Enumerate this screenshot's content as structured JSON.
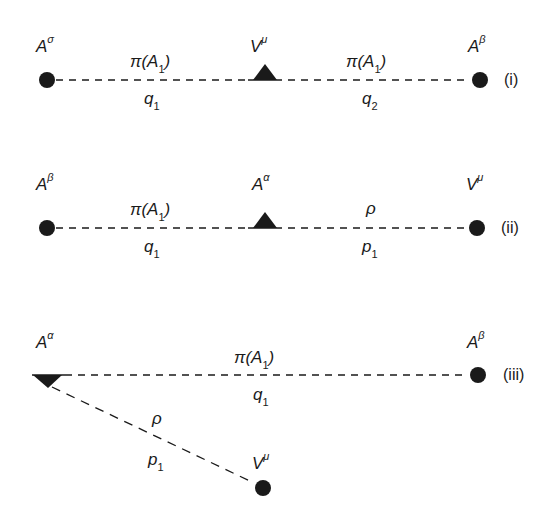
{
  "diagrams": [
    {
      "id": "i",
      "tag": "(i)",
      "left_vertex": {
        "base": "A",
        "sup": "σ",
        "marker": "circle"
      },
      "middle_vertex": {
        "base": "V",
        "sup": "μ",
        "marker": "triangle"
      },
      "right_vertex": {
        "base": "A",
        "sup": "β",
        "marker": "circle"
      },
      "left_propagator": {
        "particle": "π(A",
        "particle_sub": "1",
        "particle_close": ")",
        "momentum": "q",
        "momentum_sub": "1"
      },
      "right_propagator": {
        "particle": "π(A",
        "particle_sub": "1",
        "particle_close": ")",
        "momentum": "q",
        "momentum_sub": "2"
      }
    },
    {
      "id": "ii",
      "tag": "(ii)",
      "left_vertex": {
        "base": "A",
        "sup": "β",
        "marker": "circle"
      },
      "middle_vertex": {
        "base": "A",
        "sup": "α",
        "marker": "triangle"
      },
      "right_vertex": {
        "base": "V",
        "sup": "μ",
        "marker": "circle"
      },
      "left_propagator": {
        "particle": "π(A",
        "particle_sub": "1",
        "particle_close": ")",
        "momentum": "q",
        "momentum_sub": "1"
      },
      "right_propagator": {
        "particle": "ρ",
        "momentum": "p",
        "momentum_sub": "1"
      }
    },
    {
      "id": "iii",
      "tag": "(iii)",
      "left_vertex": {
        "base": "A",
        "sup": "α",
        "marker": "half-triangle"
      },
      "right_vertex": {
        "base": "A",
        "sup": "β",
        "marker": "circle"
      },
      "bottom_vertex": {
        "base": "V",
        "sup": "μ",
        "marker": "circle"
      },
      "horizontal_propagator": {
        "particle": "π(A",
        "particle_sub": "1",
        "particle_close": ")",
        "momentum": "q",
        "momentum_sub": "1"
      },
      "diagonal_propagator": {
        "particle": "ρ",
        "momentum": "p",
        "momentum_sub": "1"
      }
    }
  ],
  "colors": {
    "ink": "#1a1a1a",
    "background": "#ffffff"
  }
}
